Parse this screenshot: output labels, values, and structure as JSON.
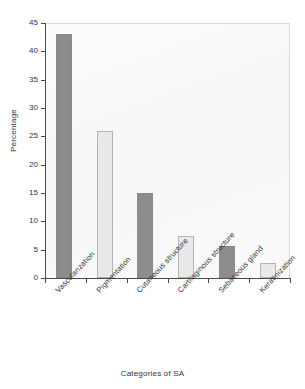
{
  "chart_data": {
    "type": "bar",
    "title": "",
    "xlabel": "Categories of SA",
    "ylabel": "Percentage",
    "categories": [
      "Vascularization",
      "Pigmentation",
      "Cutaneous structure",
      "Cartilaginous structure",
      "Sebaceous gland",
      "Keratinization"
    ],
    "values": [
      43,
      26,
      15,
      7.5,
      5.6,
      2.6
    ],
    "ylim": [
      0,
      45
    ],
    "yticks": [
      0,
      5,
      10,
      15,
      20,
      25,
      30,
      35,
      40,
      45
    ],
    "ytick_labels": [
      "0",
      "5",
      "10",
      "15",
      "20",
      "25",
      "30",
      "35",
      "40",
      "45"
    ],
    "grid": false,
    "legend": "none",
    "bar_styles": [
      "dark",
      "light",
      "dark",
      "light",
      "dark",
      "light"
    ],
    "colors": {
      "bar_dark": "#8c8c8c",
      "bar_light": "#e9e9e9",
      "bar_light_border": "#b4b4b4",
      "axis": "#4a4a4a",
      "plot_background": "#fbfbfb",
      "text": "#333333"
    }
  }
}
